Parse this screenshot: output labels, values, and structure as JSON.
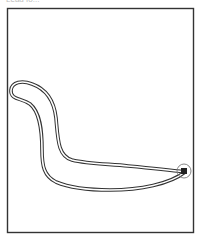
{
  "caption": {
    "text": "Lead fo..."
  },
  "figure": {
    "frame_color": "#333333",
    "line_color": "#333333",
    "background": "#ffffff",
    "marker": "circled-tip"
  }
}
